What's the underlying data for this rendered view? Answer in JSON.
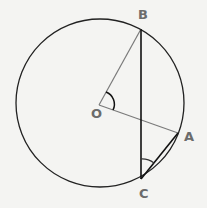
{
  "diagram": {
    "type": "circle-geometry",
    "points": {
      "B": {
        "label": "B",
        "x": 141,
        "y": 29
      },
      "O": {
        "label": "O",
        "x": 99,
        "y": 105
      },
      "A": {
        "label": "A",
        "x": 178,
        "y": 133
      },
      "C": {
        "label": "C",
        "x": 141,
        "y": 179
      }
    },
    "circle": {
      "center": "O",
      "cx": 100,
      "cy": 103,
      "r": 84
    },
    "segments": [
      "OB",
      "OA",
      "BC",
      "CA"
    ],
    "angles_marked": [
      "BOA",
      "BCA"
    ],
    "colors": {
      "circle": "#222222",
      "radius": "#7a7a7a",
      "chord": "#111111",
      "label": "#6b6b6b",
      "background": "#f4f4f2"
    }
  }
}
